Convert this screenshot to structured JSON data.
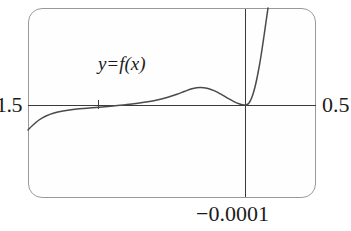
{
  "figure": {
    "kind": "graphing-calculator-window",
    "curve_label": {
      "lhs": "y",
      "operator": "=",
      "rhs": "f(x)",
      "full": "y = f(x)"
    },
    "axis_labels": {
      "left": "1.5",
      "right": "0.5",
      "bottom": "−0.0001"
    },
    "colors": {
      "frame": "#9a9a9a",
      "axis": "#3a3a3a",
      "curve": "#4a4a4a",
      "background": "#fefefe",
      "text": "#1b1b1b"
    }
  },
  "chart_data": {
    "type": "line",
    "title": "",
    "subtitle": "",
    "xlabel": "",
    "ylabel": "",
    "annotations": [
      {
        "text": "y = f(x)",
        "x_px": 98,
        "y_px": 54,
        "role": "curve-label"
      },
      {
        "text": "1.5",
        "x_px": -4,
        "y_px": 94,
        "role": "x-axis-left-endpoint"
      },
      {
        "text": "0.5",
        "x_px": 322,
        "y_px": 94,
        "role": "x-axis-right-endpoint"
      },
      {
        "text": "−0.0001",
        "x_px": 196,
        "y_px": 203,
        "role": "y-axis-min-label"
      }
    ],
    "tick_labels": {
      "x": [
        "1.5",
        "0.5"
      ],
      "y": [
        "−0.0001"
      ]
    },
    "xlim": [
      -1.5,
      0.5
    ],
    "ylim": [
      -0.0001,
      0.0001
    ],
    "grid": false,
    "legend": false,
    "axis_origin_px": {
      "x": 245,
      "y": 105
    },
    "axis_tick_px": {
      "x": 98,
      "y": 105
    },
    "series": [
      {
        "name": "f",
        "comment": "curve sampled as pixel coordinates inside the 351x231 figure",
        "points_px": [
          [
            28,
            130
          ],
          [
            33,
            125
          ],
          [
            39,
            120
          ],
          [
            46,
            116
          ],
          [
            54,
            113
          ],
          [
            63,
            111
          ],
          [
            73,
            109.5
          ],
          [
            84,
            108.4
          ],
          [
            96,
            107.4
          ],
          [
            108,
            106.4
          ],
          [
            120,
            105.3
          ],
          [
            132,
            104.0
          ],
          [
            144,
            102.3
          ],
          [
            156,
            100.2
          ],
          [
            167,
            97.5
          ],
          [
            177,
            94.3
          ],
          [
            185,
            91.2
          ],
          [
            193,
            88.6
          ],
          [
            200,
            87.6
          ],
          [
            207,
            88.3
          ],
          [
            214,
            90.6
          ],
          [
            221,
            94.2
          ],
          [
            228,
            98.4
          ],
          [
            234,
            101.6
          ],
          [
            239,
            103.7
          ],
          [
            243,
            104.8
          ],
          [
            246,
            105.0
          ],
          [
            249,
            103.0
          ],
          [
            252,
            97.0
          ],
          [
            255,
            87.0
          ],
          [
            258,
            73.0
          ],
          [
            261,
            56.0
          ],
          [
            264,
            36.0
          ],
          [
            266,
            22.0
          ],
          [
            268,
            8.0
          ]
        ]
      }
    ]
  }
}
